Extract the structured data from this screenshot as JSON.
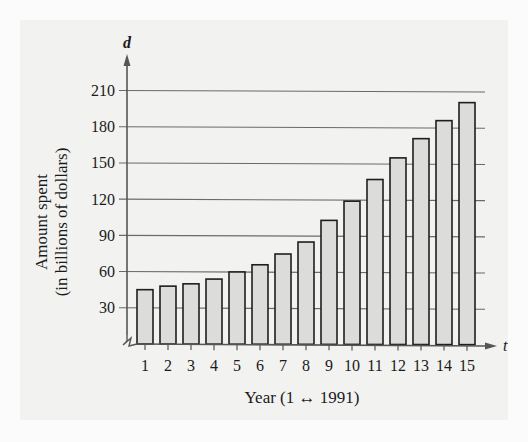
{
  "chart_data": {
    "type": "bar",
    "title": "",
    "xlabel": "Year (1 ↔ 1991)",
    "ylabel_line1": "Amount spent",
    "ylabel_line2": "(in billions of dollars)",
    "ylabel": "Amount spent (in billions of dollars)",
    "x_axis_variable": "t",
    "y_axis_variable": "d",
    "categories": [
      "1",
      "2",
      "3",
      "4",
      "5",
      "6",
      "7",
      "8",
      "9",
      "10",
      "11",
      "12",
      "13",
      "14",
      "15"
    ],
    "values": [
      45,
      48,
      50,
      54,
      60,
      66,
      75,
      85,
      103,
      119,
      137,
      155,
      171,
      186,
      201
    ],
    "yticks": [
      30,
      60,
      90,
      120,
      150,
      180,
      210
    ],
    "ylim": [
      0,
      210
    ],
    "grid": true,
    "legend": null,
    "axis_break": true,
    "colors": {
      "bar_fill": "#dcdcdb",
      "bar_stroke": "#1e1e1e",
      "grid": "#6a6a6a",
      "axis": "#555555",
      "panel": "#f2f2f1"
    }
  }
}
